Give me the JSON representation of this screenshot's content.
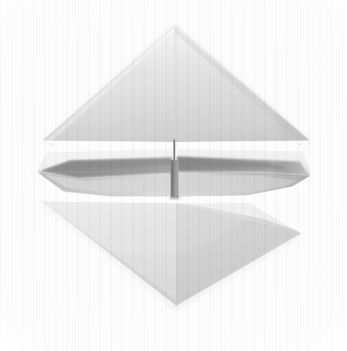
{
  "image": {
    "kind": "photograph",
    "subject": "origami-model",
    "description": "Photograph of a folded paper origami model with a diamond silhouette: a large upper triangle, a central horizontally-winged band with dark shadowed wedges and a thin vertical spine at the centre, and a large lower triangle.",
    "width": 347,
    "height": 351,
    "orientation": "portrait"
  },
  "palette": {
    "background": "#fdfdfd",
    "paper_light": "#f4f4f4",
    "paper_highlight": "#fbfbfb",
    "paper_mid": "#d8d8d8",
    "paper_shade": "#c4c4c4",
    "shadow_mid": "#9a9a9a",
    "shadow_deep": "#7f7f7f",
    "spine_dark": "#6e6e6e",
    "crease_line": "#b6b6b6",
    "gap_white": "#ffffff"
  },
  "geometry": {
    "top_triangle": {
      "apex": [
        175,
        26
      ],
      "left_base": [
        44,
        141
      ],
      "right_base": [
        309,
        141
      ],
      "label": "upper-flap"
    },
    "bottom_triangle": {
      "apex": [
        176,
        306
      ],
      "left_corner": [
        40,
        200
      ],
      "right_corner": [
        303,
        233
      ],
      "label": "lower-flap"
    },
    "center_spine": {
      "x": 174,
      "top": 139,
      "bottom": 197,
      "label": "center-spine"
    },
    "left_wing_tip": [
      37,
      172
    ],
    "right_wing_tip": [
      310,
      176
    ],
    "middle_band": {
      "top": 143,
      "bottom": 199,
      "label": "middle-wing-band"
    }
  },
  "regions": [
    {
      "name": "upper-triangle-flap",
      "tone": "light-gray paper, soft top-left to bottom-right gradient"
    },
    {
      "name": "middle-left-wing",
      "tone": "light paper with dark horizontal shadow wedge"
    },
    {
      "name": "middle-right-wing",
      "tone": "light paper with dark tapering shadow wedge"
    },
    {
      "name": "center-spine",
      "tone": "thin dark vertical crease widening to a shadowed block"
    },
    {
      "name": "lower-triangle-flap",
      "tone": "light-gray paper, gradient brightening toward lower-left"
    },
    {
      "name": "backdrop",
      "tone": "near-white with faint vertical textile striping"
    }
  ],
  "caption": {
    "alt": "Origami model photographed against a near-white textured backdrop."
  }
}
